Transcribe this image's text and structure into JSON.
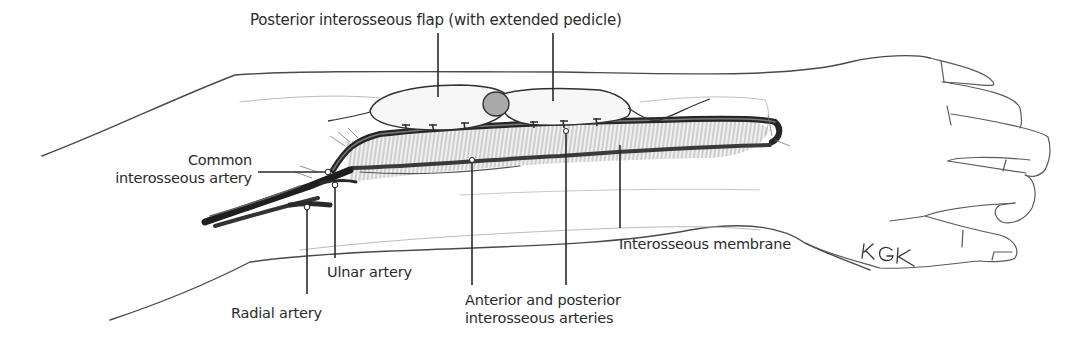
{
  "figure": {
    "type": "anatomical illustration",
    "signature": "KGK"
  },
  "labels": {
    "flap": "Posterior interosseous flap (with extended pedicle)",
    "common_line1": "Common",
    "common_line2": "interosseous artery",
    "ulnar": "Ulnar artery",
    "radial": "Radial artery",
    "ant_post_line1": "Anterior and posterior",
    "ant_post_line2": "interosseous arteries",
    "membrane": "Interosseous membrane"
  },
  "colors": {
    "line": "#2a2a2a",
    "sketch": "#555555",
    "vessel": "#333333",
    "shade": "#9a9a9a"
  }
}
